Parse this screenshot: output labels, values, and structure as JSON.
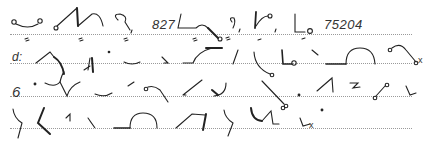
{
  "document": {
    "type": "shorthand-transcription-page",
    "lines": [
      {
        "index": 1,
        "text_fragments": [
          "827",
          "75204"
        ]
      },
      {
        "index": 2,
        "text_fragments": [
          "d:",
          "x"
        ]
      },
      {
        "index": 3,
        "text_fragments": [
          "6"
        ]
      },
      {
        "index": 4,
        "text_fragments": [
          "x"
        ]
      }
    ],
    "numbers": {
      "first": "827",
      "second": "75204"
    },
    "digits": {
      "line3_start": "6"
    },
    "marks": {
      "line2_start": "d:",
      "line2_end": "x",
      "line4_end": "x"
    },
    "colors": {
      "ink": "#222222",
      "rule": "#9a9a9a",
      "background": "#ffffff"
    }
  }
}
